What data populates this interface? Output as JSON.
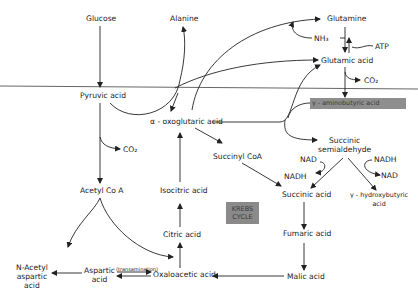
{
  "diagram": {
    "divider": "horizontal membrane line",
    "nodes": {
      "glucose": "Glucose",
      "alanine": "Alanine",
      "glutamine": "Glutamine",
      "nh3": "NH₃",
      "atp": "ATP",
      "glutamic_acid": "Glutamic acid",
      "co2_top": "CO₂",
      "pyruvic_acid": "Pyruvic acid",
      "gaba": "γ - aminobutyric acid",
      "alpha_oxoglutaric": "α - oxoglutaric acid",
      "co2_left": "CO₂",
      "succinyl_coa": "Succinyl CoA",
      "succinic_semialdehyde_1": "Succinic",
      "succinic_semialdehyde_2": "semialdehyde",
      "nad_left": "NAD",
      "nadh_left": "NADH",
      "nadh_right": "NADH",
      "nad_right": "NAD",
      "hydroxybutyric_1": "γ - hydroxybutyric",
      "hydroxybutyric_2": "acid",
      "acetyl_coa": "Acetyl Co A",
      "isocitric_acid": "Isocitric acid",
      "succinic_acid": "Succinic acid",
      "krebs_1": "KREBS",
      "krebs_2": "CYCLE",
      "citric_acid": "Citric acid",
      "fumaric_acid": "Fumaric acid",
      "n_acetyl_1": "N-Acetyl",
      "n_acetyl_2": "aspartic",
      "n_acetyl_3": "acid",
      "aspartic_1": "Aspartic",
      "aspartic_2": "acid",
      "transamination": "(transamination)",
      "oxaloacetic_acid": "Oxaloacetic acid",
      "malic_acid": "Malic acid"
    },
    "colors": {
      "highlight_box": "#8a8a8a",
      "line": "#222222",
      "divider": "#666666"
    }
  }
}
